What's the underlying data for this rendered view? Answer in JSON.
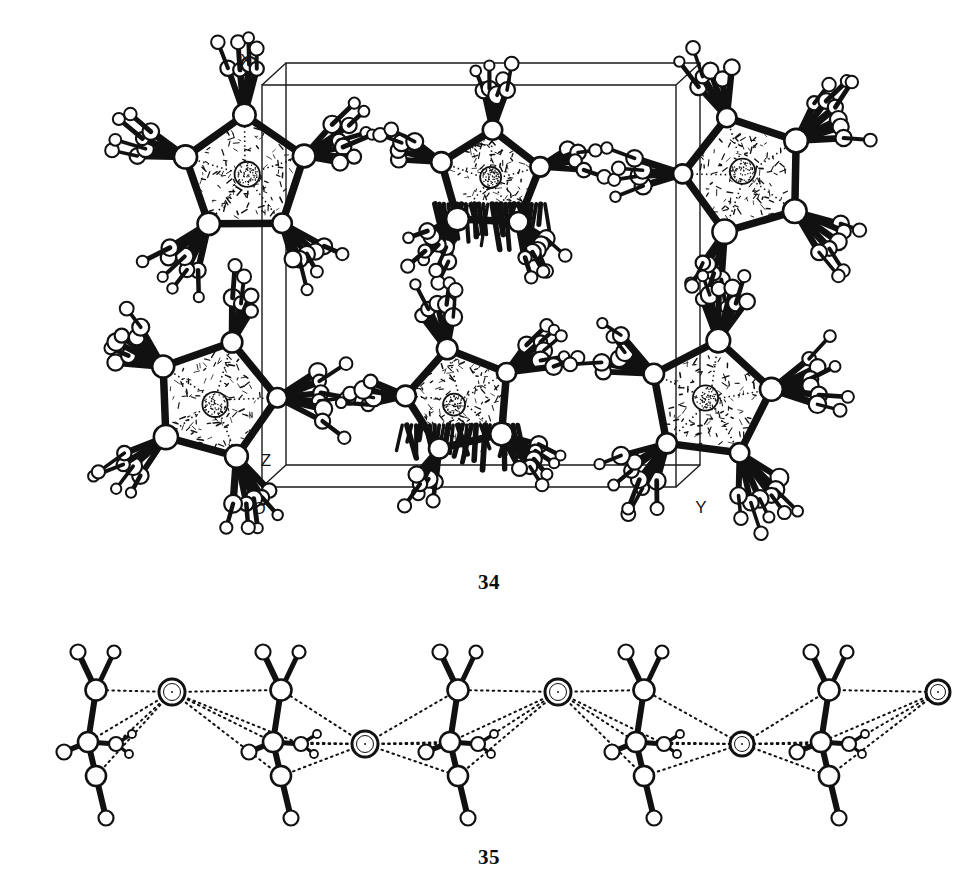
{
  "page": {
    "kind": "scientific-figure-plate",
    "background_color": "#ffffff",
    "ink_color": "#111111"
  },
  "figures": [
    {
      "id": "fig34",
      "number": "34",
      "type": "crystal-packing-unit-cell",
      "description": "Unit cell packing diagram of bulky organometallic cluster molecules viewed along an axis, drawn in ball-and-stick style with open circles for outer atoms and a stippled sphere at each molecular centre.",
      "axis_labels": [
        {
          "name": "x-axis-label",
          "text": "X",
          "x": 246,
          "y": 66
        },
        {
          "name": "y-axis-label",
          "text": "Y",
          "x": 701,
          "y": 513
        },
        {
          "name": "z-axis-label",
          "text": "Z",
          "x": 266,
          "y": 466
        },
        {
          "name": "origin-label",
          "text": "O",
          "x": 259,
          "y": 514
        }
      ],
      "unit_cell": {
        "line_color": "#1a1a1a",
        "line_width": 1.4,
        "front_face": [
          [
            262,
            85
          ],
          [
            676,
            85
          ],
          [
            676,
            487
          ],
          [
            262,
            487
          ]
        ],
        "depth_offset": [
          24,
          -22
        ]
      },
      "molecule_count": 6,
      "molecules": [
        {
          "name": "molecule-top-left",
          "cx": 245,
          "cy": 175,
          "r": 120,
          "shade": "light"
        },
        {
          "name": "molecule-top-center",
          "cx": 490,
          "cy": 180,
          "r": 100,
          "shade": "dark"
        },
        {
          "name": "molecule-top-right",
          "cx": 745,
          "cy": 175,
          "r": 120,
          "shade": "light"
        },
        {
          "name": "molecule-bottom-left",
          "cx": 215,
          "cy": 400,
          "r": 120,
          "shade": "light"
        },
        {
          "name": "molecule-bottom-center",
          "cx": 460,
          "cy": 400,
          "r": 105,
          "shade": "dark"
        },
        {
          "name": "molecule-bottom-right",
          "cx": 710,
          "cy": 400,
          "r": 120,
          "shade": "light"
        }
      ]
    },
    {
      "id": "fig35",
      "number": "35",
      "type": "polymeric-chain",
      "description": "One-dimensional zig-zag coordination polymer: five molecular units linked through bridging atoms by dotted interactions.",
      "unit_count": 5,
      "bridge_count": 4,
      "units": [
        {
          "name": "chain-unit-1",
          "cx": 100,
          "cy": 730
        },
        {
          "name": "chain-unit-2",
          "cx": 285,
          "cy": 730
        },
        {
          "name": "chain-unit-3",
          "cx": 462,
          "cy": 730
        },
        {
          "name": "chain-unit-4",
          "cx": 648,
          "cy": 730
        },
        {
          "name": "chain-unit-5",
          "cx": 833,
          "cy": 730
        }
      ],
      "bridges": [
        {
          "name": "bridge-atom-1",
          "cx": 172,
          "cy": 692,
          "r": 13
        },
        {
          "name": "bridge-atom-2",
          "cx": 365,
          "cy": 744,
          "r": 13
        },
        {
          "name": "bridge-atom-3",
          "cx": 558,
          "cy": 692,
          "r": 13
        },
        {
          "name": "bridge-atom-4",
          "cx": 742,
          "cy": 744,
          "r": 12
        },
        {
          "name": "bridge-atom-5",
          "cx": 938,
          "cy": 692,
          "r": 12
        }
      ],
      "bond_style": {
        "solid": "#111111",
        "dotted": "#111111",
        "dot_pattern": "1.6 4.2"
      }
    }
  ],
  "captions": {
    "fig34": "34",
    "fig35": "35"
  }
}
